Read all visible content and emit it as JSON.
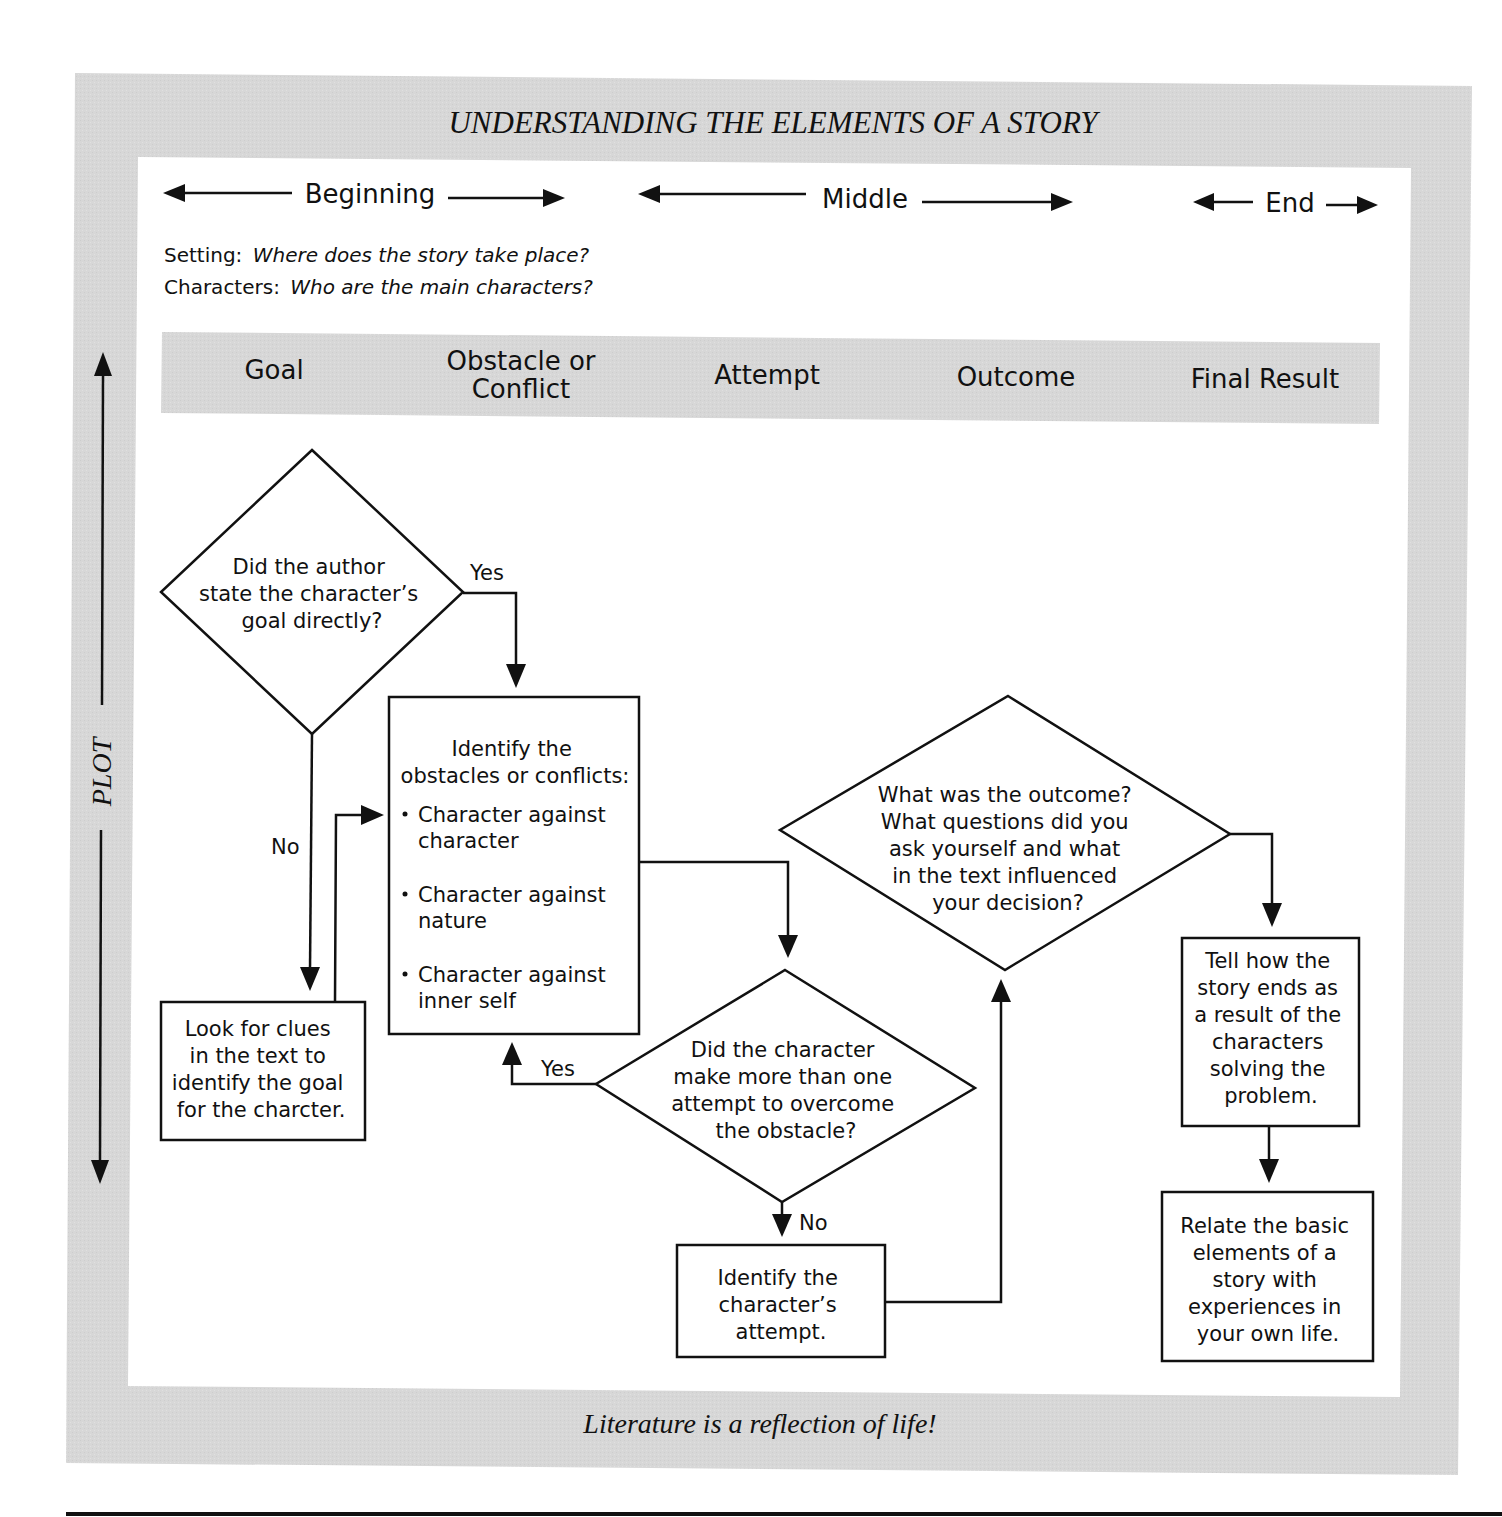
{
  "title": "UNDERSTANDING THE ELEMENTS OF A STORY",
  "story_parts": {
    "beginning": "Beginning",
    "middle": "Middle",
    "end": "End"
  },
  "intro": {
    "setting_label": "Setting:",
    "setting_question": "Where does the story take place?",
    "characters_label": "Characters:",
    "characters_question": "Who are the main characters?"
  },
  "plot_label": "PLOT",
  "header_band": {
    "columns": [
      {
        "line1": "Goal",
        "line2": ""
      },
      {
        "line1": "Obstacle or",
        "line2": "Conflict"
      },
      {
        "line1": "Attempt",
        "line2": ""
      },
      {
        "line1": "Outcome",
        "line2": ""
      },
      {
        "line1": "Final Result",
        "line2": ""
      }
    ]
  },
  "flowchart": {
    "goal_decision": {
      "lines": [
        "Did the author",
        "state the character’s",
        "goal directly?"
      ],
      "yes_label": "Yes",
      "no_label": "No"
    },
    "look_for_clues": {
      "lines": [
        "Look for clues",
        "in the text to",
        "identify the goal",
        "for the charcter."
      ]
    },
    "identify_obstacles": {
      "heading": [
        "Identify the",
        "obstacles or conflicts:"
      ],
      "bullets": [
        [
          "Character against",
          "character"
        ],
        [
          "Character against",
          "nature"
        ],
        [
          "Character against",
          "inner self"
        ]
      ]
    },
    "attempt_decision": {
      "lines": [
        "Did the character",
        "make more than one",
        "attempt to overcome",
        "the obstacle?"
      ],
      "yes_label": "Yes",
      "no_label": "No"
    },
    "identify_attempt": {
      "lines": [
        "Identify the",
        "character’s",
        "attempt."
      ]
    },
    "outcome_decision": {
      "lines": [
        "What was the outcome?",
        "What questions did you",
        "ask yourself and what",
        "in the text influenced",
        "your decision?"
      ]
    },
    "tell_ending": {
      "lines": [
        "Tell how the",
        "story ends as",
        "a result of the",
        "characters",
        "solving the",
        "problem."
      ]
    },
    "relate_elements": {
      "lines": [
        "Relate the basic",
        "elements of a",
        "story with",
        "experiences in",
        "your own life."
      ]
    }
  },
  "footer": "Literature is a reflection of life!",
  "colors": {
    "frame_gray": "#d6d6d6",
    "band_gray": "#d9d9d9",
    "ink": "#111111",
    "panel": "#ffffff"
  }
}
